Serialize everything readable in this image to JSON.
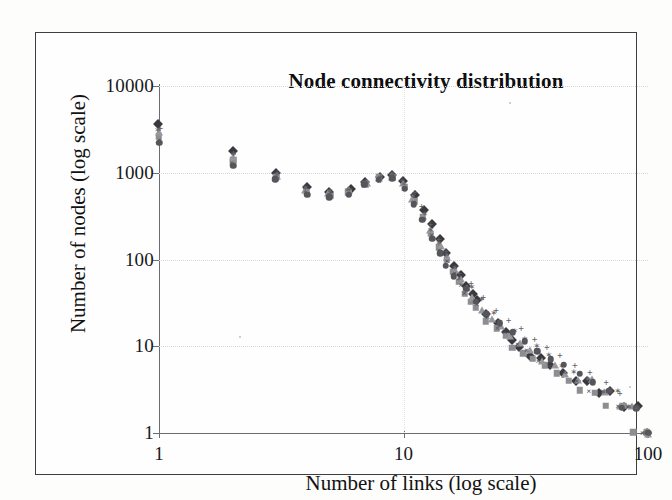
{
  "figure": {
    "background_color": "#fdfdfc",
    "frame_color": "#3f3f42"
  },
  "chart_data": {
    "type": "scatter",
    "title": "Node connectivity distribution",
    "xlabel": "Number of links (log scale)",
    "ylabel": "Number of nodes (log scale)",
    "xscale": "log",
    "yscale": "log",
    "xlim": [
      1,
      100
    ],
    "ylim": [
      1,
      10000
    ],
    "xticks": [
      1,
      10,
      100
    ],
    "xticklabels": [
      "1",
      "10",
      "100"
    ],
    "yticks": [
      1,
      10,
      100,
      1000,
      10000
    ],
    "yticklabels": [
      "1",
      "10",
      "100",
      "1000",
      "10000"
    ],
    "grid": true,
    "legend": "none",
    "note": "Overlapping multi-series scatter; each series is one network sample showing a power-law (scale-free) degree distribution with a plateau below k=9 and a steep decay beyond.",
    "series": [
      {
        "name": "series-1",
        "marker": "diamond",
        "color": "#3a3a3e",
        "x": [
          1,
          2,
          3,
          4,
          5,
          6,
          7,
          8,
          9,
          10,
          11,
          12,
          13,
          14,
          15,
          16,
          17,
          18,
          19,
          20,
          22,
          24,
          26,
          28,
          30,
          33,
          36,
          40,
          45,
          50,
          56,
          63,
          70,
          80,
          90,
          100
        ],
        "y": [
          3800,
          1750,
          980,
          660,
          600,
          640,
          800,
          900,
          950,
          800,
          560,
          380,
          250,
          170,
          120,
          88,
          66,
          50,
          40,
          33,
          24,
          19,
          15,
          12,
          10,
          8,
          7,
          6,
          5,
          4,
          4,
          3,
          3,
          2,
          2,
          1
        ]
      },
      {
        "name": "series-2",
        "marker": "square",
        "color": "#8d8d92",
        "x": [
          1,
          2,
          3,
          4,
          5,
          6,
          7,
          8,
          9,
          10,
          11,
          12,
          13,
          14,
          15,
          16,
          17,
          18,
          19,
          20,
          22,
          24,
          26,
          28,
          31,
          34,
          38,
          42,
          47,
          53,
          60,
          68,
          78,
          88,
          100
        ],
        "y": [
          2600,
          1350,
          880,
          610,
          560,
          600,
          760,
          860,
          880,
          700,
          470,
          310,
          200,
          135,
          96,
          72,
          55,
          42,
          34,
          27,
          20,
          16,
          13,
          10,
          8,
          7,
          6,
          5,
          4,
          3,
          3,
          2,
          2,
          1,
          1
        ]
      },
      {
        "name": "series-3",
        "marker": "triangle",
        "color": "#97979c",
        "x": [
          1,
          2,
          3,
          4,
          5,
          6,
          7,
          8,
          9,
          10,
          11,
          12,
          13,
          14,
          15,
          16,
          17,
          18,
          19,
          21,
          23,
          25,
          27,
          30,
          33,
          37,
          41,
          46,
          52,
          59,
          67,
          76,
          86,
          100
        ],
        "y": [
          2900,
          1500,
          920,
          640,
          580,
          620,
          780,
          880,
          900,
          740,
          500,
          330,
          215,
          145,
          104,
          78,
          58,
          45,
          36,
          27,
          21,
          17,
          13,
          11,
          9,
          7,
          6,
          5,
          4,
          4,
          3,
          2,
          2,
          1
        ]
      },
      {
        "name": "series-4",
        "marker": "cross",
        "color": "#4b4b50",
        "x": [
          1,
          2,
          3,
          4,
          5,
          6,
          7,
          8,
          9,
          10,
          11,
          12,
          13,
          14,
          15,
          16,
          17,
          18,
          20,
          22,
          24,
          26,
          29,
          32,
          36,
          40,
          45,
          51,
          58,
          66,
          75,
          85,
          96
        ],
        "y": [
          2400,
          1280,
          850,
          590,
          545,
          580,
          740,
          840,
          860,
          680,
          450,
          295,
          190,
          128,
          92,
          68,
          52,
          40,
          30,
          22,
          17,
          14,
          11,
          9,
          7,
          6,
          5,
          4,
          3,
          3,
          2,
          2,
          1
        ]
      },
      {
        "name": "series-5",
        "marker": "star",
        "color": "#6a6a6f",
        "x": [
          1,
          2,
          3,
          4,
          5,
          6,
          7,
          8,
          9,
          10,
          11,
          12,
          13,
          14,
          15,
          16,
          17,
          19,
          21,
          23,
          25,
          28,
          31,
          35,
          39,
          44,
          50,
          57,
          65,
          74,
          84,
          95
        ],
        "y": [
          3200,
          1600,
          950,
          650,
          590,
          630,
          790,
          890,
          930,
          770,
          520,
          345,
          225,
          152,
          110,
          82,
          61,
          46,
          34,
          25,
          20,
          15,
          12,
          10,
          8,
          6,
          5,
          4,
          3,
          3,
          2,
          1
        ]
      },
      {
        "name": "series-6",
        "marker": "circle",
        "color": "#55555a",
        "x": [
          1,
          2,
          3,
          4,
          5,
          6,
          7,
          8,
          9,
          10,
          11,
          12,
          13,
          14,
          15,
          16,
          18,
          20,
          22,
          25,
          28,
          31,
          35,
          40,
          45,
          52,
          60,
          69,
          79,
          90,
          100
        ],
        "y": [
          2200,
          1200,
          820,
          575,
          530,
          565,
          720,
          820,
          840,
          650,
          430,
          280,
          180,
          120,
          86,
          64,
          46,
          32,
          24,
          18,
          14,
          11,
          9,
          7,
          6,
          5,
          4,
          3,
          2,
          2,
          1
        ]
      },
      {
        "name": "series-7",
        "marker": "plus",
        "color": "#5e5e63",
        "x": [
          1,
          2,
          3,
          4,
          5,
          6,
          7,
          8,
          9,
          10,
          11,
          12,
          13,
          14,
          15,
          17,
          19,
          21,
          24,
          27,
          30,
          34,
          39,
          44,
          50,
          58,
          67,
          77,
          88,
          100
        ],
        "y": [
          3400,
          1680,
          1000,
          670,
          610,
          650,
          810,
          920,
          970,
          820,
          580,
          395,
          258,
          176,
          126,
          72,
          52,
          38,
          27,
          20,
          16,
          12,
          10,
          8,
          6,
          5,
          4,
          3,
          2,
          1
        ]
      }
    ]
  }
}
